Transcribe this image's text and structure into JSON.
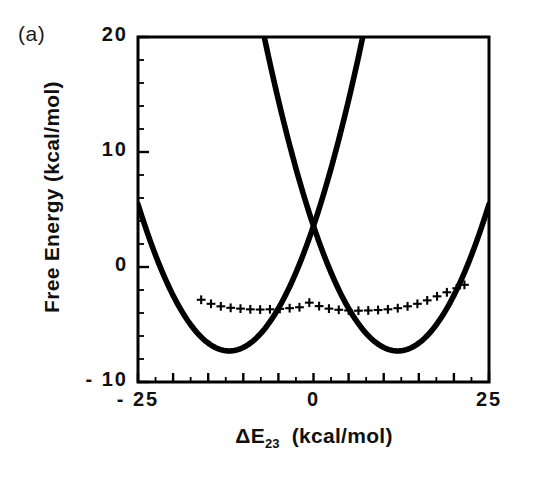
{
  "panel": {
    "label": "(a)"
  },
  "chart_data": {
    "type": "line",
    "title": "",
    "subtitle": "",
    "xlabel": "ΔE23  (kcal/mol)",
    "xlabel_base": "ΔE",
    "xlabel_sub": "23",
    "xlabel_units": "(kcal/mol)",
    "ylabel": "Free Energy  (kcal/mol)",
    "xlim": [
      -25,
      25
    ],
    "ylim": [
      -10,
      20
    ],
    "xticks": [
      -25,
      0,
      25
    ],
    "xtick_labels": [
      "-25",
      "0",
      "25"
    ],
    "yticks": [
      -10,
      0,
      10,
      20
    ],
    "ytick_labels": [
      "-10",
      "0",
      "10",
      "20"
    ],
    "x_major_step": 5,
    "x_minor_step": 2.5,
    "y_major_step": 10,
    "y_minor_step": 2,
    "grid": false,
    "legend": null,
    "frame_color": "#000000",
    "series": [
      {
        "name": "diabatic-well-left",
        "style": "solid-thick",
        "color": "#000000",
        "comment": "Upward parabola centered near x = -12, minimum about -7.3",
        "vertex": [
          -12.0,
          -7.3
        ],
        "curvature": 0.0755,
        "x": [
          -25,
          -23,
          -21,
          -19,
          -17,
          -15,
          -13,
          -11,
          -9,
          -7,
          -5,
          -3,
          -1,
          0,
          1,
          3,
          5,
          7,
          9,
          11,
          13,
          15,
          17,
          19,
          21,
          23,
          25
        ],
        "y": [
          5.5,
          1.8,
          -1.2,
          -3.4,
          -5.0,
          -6.4,
          -7.2,
          -7.3,
          -6.6,
          -5.4,
          -3.6,
          -1.2,
          1.8,
          3.6,
          5.4,
          9.7,
          14.5,
          20.0,
          20.0,
          20.0,
          20.0,
          20.0,
          20.0,
          20.0,
          20.0,
          20.0,
          20.0
        ]
      },
      {
        "name": "diabatic-well-right",
        "style": "solid-thick",
        "color": "#000000",
        "comment": "Upward parabola centered near x = +12, minimum about -7.3",
        "vertex": [
          12.0,
          -7.3
        ],
        "curvature": 0.0755,
        "x": [
          -25,
          -23,
          -21,
          -19,
          -17,
          -15,
          -13,
          -11,
          -9,
          -7,
          -5,
          -3,
          -1,
          0,
          1,
          3,
          5,
          7,
          9,
          11,
          13,
          15,
          17,
          19,
          21,
          23,
          25
        ],
        "y": [
          20.0,
          20.0,
          20.0,
          20.0,
          20.0,
          20.0,
          20.0,
          20.0,
          20.0,
          14.5,
          9.7,
          5.4,
          3.6,
          1.8,
          1.2,
          -1.2,
          -3.6,
          -5.4,
          -6.6,
          -7.3,
          -7.2,
          -6.4,
          -5.0,
          -3.4,
          -1.2,
          1.8,
          5.5
        ]
      },
      {
        "name": "adiabatic-ground-surface",
        "style": "plus-markers",
        "marker": "+",
        "color": "#000000",
        "comment": "Plus symbols tracing the shallow adiabatic ground state",
        "x": [
          -16.0,
          -14.6,
          -13.2,
          -11.8,
          -10.4,
          -9.0,
          -7.6,
          -6.2,
          -4.8,
          -3.4,
          -2.0,
          -0.6,
          0.8,
          2.2,
          3.6,
          5.0,
          6.4,
          7.8,
          9.2,
          10.6,
          12.0,
          13.4,
          14.8,
          16.2,
          17.6,
          19.0,
          20.4,
          21.5
        ],
        "y": [
          -2.85,
          -3.2,
          -3.42,
          -3.55,
          -3.62,
          -3.68,
          -3.7,
          -3.68,
          -3.64,
          -3.58,
          -3.5,
          -3.1,
          -3.4,
          -3.62,
          -3.72,
          -3.78,
          -3.8,
          -3.78,
          -3.74,
          -3.68,
          -3.58,
          -3.42,
          -3.2,
          -2.9,
          -2.55,
          -2.2,
          -1.85,
          -1.55
        ]
      }
    ]
  }
}
